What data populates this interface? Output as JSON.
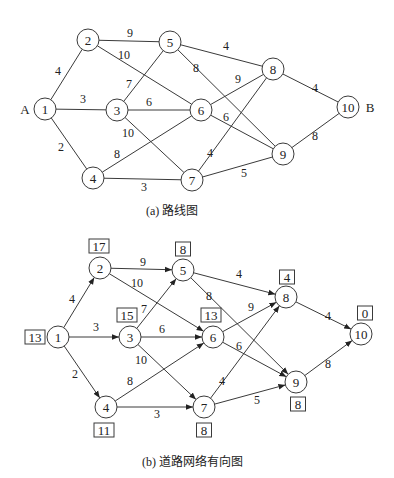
{
  "top": {
    "caption": "(a) 路线图",
    "start_label": "A",
    "end_label": "B",
    "nodes": [
      {
        "id": "1",
        "x": 45,
        "y": 109
      },
      {
        "id": "2",
        "x": 88,
        "y": 40
      },
      {
        "id": "3",
        "x": 117,
        "y": 110
      },
      {
        "id": "4",
        "x": 93,
        "y": 178
      },
      {
        "id": "5",
        "x": 170,
        "y": 42
      },
      {
        "id": "6",
        "x": 201,
        "y": 110
      },
      {
        "id": "7",
        "x": 192,
        "y": 180
      },
      {
        "id": "8",
        "x": 273,
        "y": 69
      },
      {
        "id": "9",
        "x": 283,
        "y": 154
      },
      {
        "id": "10",
        "x": 348,
        "y": 107
      }
    ],
    "edges": [
      {
        "from": "1",
        "to": "2",
        "w": "4",
        "lx": 58,
        "ly": 75
      },
      {
        "from": "1",
        "to": "3",
        "w": "3",
        "lx": 83,
        "ly": 103
      },
      {
        "from": "1",
        "to": "4",
        "w": "2",
        "lx": 61,
        "ly": 151
      },
      {
        "from": "2",
        "to": "5",
        "w": "9",
        "lx": 130,
        "ly": 37
      },
      {
        "from": "2",
        "to": "6",
        "w": "10",
        "lx": 124,
        "ly": 59
      },
      {
        "from": "3",
        "to": "5",
        "w": "7",
        "lx": 129,
        "ly": 88
      },
      {
        "from": "3",
        "to": "6",
        "w": "6",
        "lx": 149,
        "ly": 106
      },
      {
        "from": "3",
        "to": "7",
        "w": "10",
        "lx": 128,
        "ly": 137
      },
      {
        "from": "4",
        "to": "6",
        "w": "8",
        "lx": 117,
        "ly": 158
      },
      {
        "from": "4",
        "to": "7",
        "w": "3",
        "lx": 144,
        "ly": 191
      },
      {
        "from": "5",
        "to": "8",
        "w": "4",
        "lx": 226,
        "ly": 50
      },
      {
        "from": "5",
        "to": "9",
        "w": "8",
        "lx": 196,
        "ly": 72
      },
      {
        "from": "6",
        "to": "8",
        "w": "9",
        "lx": 238,
        "ly": 83
      },
      {
        "from": "6",
        "to": "9",
        "w": "6",
        "lx": 226,
        "ly": 121
      },
      {
        "from": "7",
        "to": "8",
        "w": "4",
        "lx": 210,
        "ly": 157
      },
      {
        "from": "7",
        "to": "9",
        "w": "5",
        "lx": 244,
        "ly": 177
      },
      {
        "from": "8",
        "to": "10",
        "w": "4",
        "lx": 315,
        "ly": 92
      },
      {
        "from": "9",
        "to": "10",
        "w": "8",
        "lx": 315,
        "ly": 140
      }
    ]
  },
  "bottom": {
    "caption": "(b) 道路网络有向图",
    "nodes": [
      {
        "id": "1",
        "x": 58,
        "y": 337,
        "value": "13",
        "bx": 35,
        "by": 337
      },
      {
        "id": "2",
        "x": 100,
        "y": 268,
        "value": "17",
        "bx": 99,
        "by": 246
      },
      {
        "id": "3",
        "x": 130,
        "y": 337,
        "value": "15",
        "bx": 127,
        "by": 315
      },
      {
        "id": "4",
        "x": 106,
        "y": 407,
        "value": "11",
        "bx": 104,
        "by": 430
      },
      {
        "id": "5",
        "x": 183,
        "y": 270,
        "value": "8",
        "bx": 183,
        "by": 249
      },
      {
        "id": "6",
        "x": 213,
        "y": 337,
        "value": "13",
        "bx": 211,
        "by": 315
      },
      {
        "id": "7",
        "x": 204,
        "y": 407,
        "value": "8",
        "bx": 204,
        "by": 430
      },
      {
        "id": "8",
        "x": 286,
        "y": 297,
        "value": "4",
        "bx": 287,
        "by": 277
      },
      {
        "id": "9",
        "x": 296,
        "y": 382,
        "value": "8",
        "bx": 298,
        "by": 404
      },
      {
        "id": "10",
        "x": 361,
        "y": 334,
        "value": "0",
        "bx": 365,
        "by": 313
      }
    ],
    "edges": [
      {
        "from": "1",
        "to": "2",
        "w": "4",
        "lx": 72,
        "ly": 303
      },
      {
        "from": "1",
        "to": "3",
        "w": "3",
        "lx": 96,
        "ly": 331
      },
      {
        "from": "1",
        "to": "4",
        "w": "2",
        "lx": 75,
        "ly": 378
      },
      {
        "from": "2",
        "to": "5",
        "w": "9",
        "lx": 143,
        "ly": 266
      },
      {
        "from": "2",
        "to": "6",
        "w": "10",
        "lx": 137,
        "ly": 287
      },
      {
        "from": "3",
        "to": "5",
        "w": "7",
        "lx": 144,
        "ly": 313
      },
      {
        "from": "3",
        "to": "6",
        "w": "6",
        "lx": 162,
        "ly": 333
      },
      {
        "from": "3",
        "to": "7",
        "w": "10",
        "lx": 141,
        "ly": 364
      },
      {
        "from": "4",
        "to": "6",
        "w": "8",
        "lx": 130,
        "ly": 385
      },
      {
        "from": "4",
        "to": "7",
        "w": "3",
        "lx": 157,
        "ly": 418
      },
      {
        "from": "5",
        "to": "8",
        "w": "4",
        "lx": 239,
        "ly": 278
      },
      {
        "from": "5",
        "to": "9",
        "w": "8",
        "lx": 209,
        "ly": 300
      },
      {
        "from": "6",
        "to": "8",
        "w": "9",
        "lx": 251,
        "ly": 311
      },
      {
        "from": "6",
        "to": "9",
        "w": "6",
        "lx": 239,
        "ly": 350
      },
      {
        "from": "7",
        "to": "8",
        "w": "4",
        "lx": 222,
        "ly": 385
      },
      {
        "from": "7",
        "to": "9",
        "w": "5",
        "lx": 257,
        "ly": 404
      },
      {
        "from": "8",
        "to": "10",
        "w": "4",
        "lx": 328,
        "ly": 320
      },
      {
        "from": "9",
        "to": "10",
        "w": "8",
        "lx": 328,
        "ly": 368
      }
    ]
  }
}
